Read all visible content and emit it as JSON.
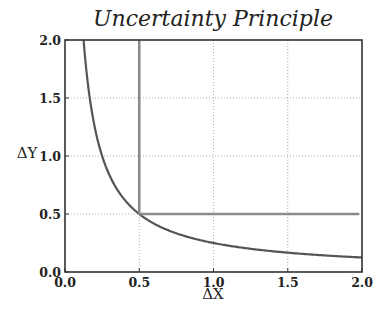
{
  "chart_data": {
    "type": "line",
    "title": "Uncertainty Principle",
    "xlabel": "ΔX",
    "ylabel": "ΔY",
    "xlim": [
      0.0,
      2.0
    ],
    "ylim": [
      0.0,
      2.0
    ],
    "xticks": [
      "0.0",
      "0.5",
      "1.0",
      "1.5",
      "2.0"
    ],
    "yticks": [
      "0.0",
      "0.5",
      "1.0",
      "1.5",
      "2.0"
    ],
    "grid": true,
    "grid_style": "dotted",
    "legend": null,
    "series": [
      {
        "name": "hyperbola ΔX·ΔY = 0.25",
        "function": "y = 0.25 / x",
        "color": "#555555",
        "x": [
          0.125,
          0.15,
          0.2,
          0.25,
          0.3,
          0.4,
          0.5,
          0.6,
          0.75,
          1.0,
          1.25,
          1.5,
          1.75,
          2.0
        ],
        "y": [
          2.0,
          1.667,
          1.25,
          1.0,
          0.833,
          0.625,
          0.5,
          0.417,
          0.333,
          0.25,
          0.2,
          0.167,
          0.143,
          0.125
        ]
      },
      {
        "name": "vertical boundary",
        "color": "#8a8a8a",
        "x": [
          0.5,
          0.5
        ],
        "y": [
          0.5,
          2.0
        ]
      },
      {
        "name": "horizontal boundary",
        "color": "#8a8a8a",
        "x": [
          0.5,
          1.98
        ],
        "y": [
          0.5,
          0.5
        ]
      }
    ]
  },
  "caption": "(caption text cut off at bottom edge)"
}
